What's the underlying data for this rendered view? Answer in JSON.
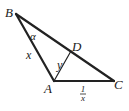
{
  "diagram": {
    "type": "triangle",
    "vertices": {
      "A": "A",
      "B": "B",
      "C": "C",
      "D": "D"
    },
    "angle_label": "α",
    "side_AB": "x",
    "segment_AD": "y",
    "side_AC_num": "1",
    "side_AC_den": "x",
    "stroke_color": "#222222"
  }
}
